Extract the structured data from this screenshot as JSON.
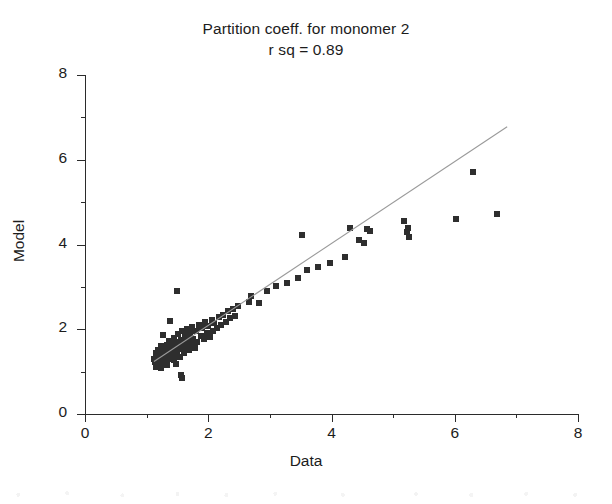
{
  "chart_data": {
    "type": "scatter",
    "title": "Partition coeff. for monomer 2",
    "subtitle": "r sq = 0.89",
    "xlabel": "Data",
    "ylabel": "Model",
    "xlim": [
      0,
      8
    ],
    "ylim": [
      0,
      8
    ],
    "grid": false,
    "legend": null,
    "x_major_ticks": [
      0,
      2,
      4,
      6,
      8
    ],
    "x_minor_ticks": [
      1,
      3,
      5,
      7
    ],
    "y_major_ticks": [
      0,
      2,
      4,
      6,
      8
    ],
    "y_minor_ticks": [
      1,
      3,
      5,
      7
    ],
    "x_tick_labels": [
      "0",
      "2",
      "4",
      "6",
      "8"
    ],
    "y_tick_labels": [
      "0",
      "2",
      "4",
      "6",
      "8"
    ],
    "marker": {
      "shape": "square",
      "color": "#2e2e2e",
      "size_px": 6
    },
    "series": [
      {
        "name": "observations",
        "points": [
          [
            1.12,
            1.3
          ],
          [
            1.14,
            1.22
          ],
          [
            1.15,
            1.44
          ],
          [
            1.16,
            1.12
          ],
          [
            1.18,
            1.35
          ],
          [
            1.19,
            1.52
          ],
          [
            1.2,
            1.25
          ],
          [
            1.21,
            1.41
          ],
          [
            1.22,
            1.18
          ],
          [
            1.23,
            1.6
          ],
          [
            1.25,
            1.33
          ],
          [
            1.26,
            1.47
          ],
          [
            1.27,
            1.21
          ],
          [
            1.28,
            1.55
          ],
          [
            1.3,
            1.38
          ],
          [
            1.31,
            1.28
          ],
          [
            1.33,
            1.62
          ],
          [
            1.34,
            1.45
          ],
          [
            1.35,
            1.3
          ],
          [
            1.36,
            1.72
          ],
          [
            1.38,
            1.5
          ],
          [
            1.39,
            1.36
          ],
          [
            1.4,
            1.58
          ],
          [
            1.41,
            1.43
          ],
          [
            1.43,
            1.66
          ],
          [
            1.44,
            1.27
          ],
          [
            1.45,
            1.8
          ],
          [
            1.46,
            1.55
          ],
          [
            1.48,
            1.4
          ],
          [
            1.49,
            1.7
          ],
          [
            1.5,
            1.48
          ],
          [
            1.51,
            1.88
          ],
          [
            1.52,
            1.6
          ],
          [
            1.54,
            1.35
          ],
          [
            1.55,
            1.75
          ],
          [
            1.56,
            1.53
          ],
          [
            1.58,
            1.95
          ],
          [
            1.59,
            1.66
          ],
          [
            1.6,
            1.44
          ],
          [
            1.62,
            1.82
          ],
          [
            1.63,
            1.58
          ],
          [
            1.65,
            2.0
          ],
          [
            1.66,
            1.72
          ],
          [
            1.68,
            1.5
          ],
          [
            1.7,
            1.9
          ],
          [
            1.72,
            1.64
          ],
          [
            1.74,
            2.05
          ],
          [
            1.76,
            1.78
          ],
          [
            1.78,
            1.56
          ],
          [
            1.8,
            1.96
          ],
          [
            1.82,
            1.7
          ],
          [
            1.85,
            2.1
          ],
          [
            1.88,
            1.84
          ],
          [
            1.9,
            2.02
          ],
          [
            1.93,
            1.76
          ],
          [
            1.95,
            2.16
          ],
          [
            1.98,
            1.9
          ],
          [
            2.0,
            2.08
          ],
          [
            2.03,
            1.82
          ],
          [
            2.06,
            2.22
          ],
          [
            2.08,
            1.96
          ],
          [
            2.1,
            2.14
          ],
          [
            2.14,
            2.02
          ],
          [
            2.18,
            2.28
          ],
          [
            2.2,
            2.1
          ],
          [
            2.24,
            2.34
          ],
          [
            2.28,
            2.18
          ],
          [
            2.32,
            2.42
          ],
          [
            2.36,
            2.26
          ],
          [
            2.4,
            2.48
          ],
          [
            2.44,
            2.32
          ],
          [
            2.48,
            2.54
          ],
          [
            1.23,
            1.08
          ],
          [
            1.33,
            1.15
          ],
          [
            1.47,
            1.18
          ],
          [
            1.26,
            1.86
          ],
          [
            1.38,
            2.2
          ],
          [
            1.5,
            2.9
          ],
          [
            1.57,
            0.85
          ],
          [
            1.56,
            0.92
          ],
          [
            1.66,
            1.86
          ],
          [
            1.75,
            1.72
          ],
          [
            2.66,
            2.64
          ],
          [
            2.7,
            2.78
          ],
          [
            2.82,
            2.62
          ],
          [
            2.95,
            2.9
          ],
          [
            3.1,
            3.02
          ],
          [
            3.28,
            3.1
          ],
          [
            3.45,
            3.22
          ],
          [
            3.52,
            4.22
          ],
          [
            3.6,
            3.4
          ],
          [
            3.78,
            3.48
          ],
          [
            3.98,
            3.56
          ],
          [
            4.22,
            3.7
          ],
          [
            4.3,
            4.4
          ],
          [
            4.45,
            4.1
          ],
          [
            4.52,
            4.04
          ],
          [
            4.58,
            4.36
          ],
          [
            4.62,
            4.32
          ],
          [
            5.18,
            4.56
          ],
          [
            5.22,
            4.3
          ],
          [
            5.24,
            4.4
          ],
          [
            5.26,
            4.18
          ],
          [
            6.02,
            4.6
          ],
          [
            6.3,
            5.7
          ],
          [
            6.68,
            4.72
          ]
        ]
      }
    ],
    "fit_line": {
      "name": "regression line",
      "color": "#9a9a9a",
      "x_start": 1.12,
      "y_start": 1.24,
      "x_end": 6.85,
      "y_end": 6.78
    }
  }
}
